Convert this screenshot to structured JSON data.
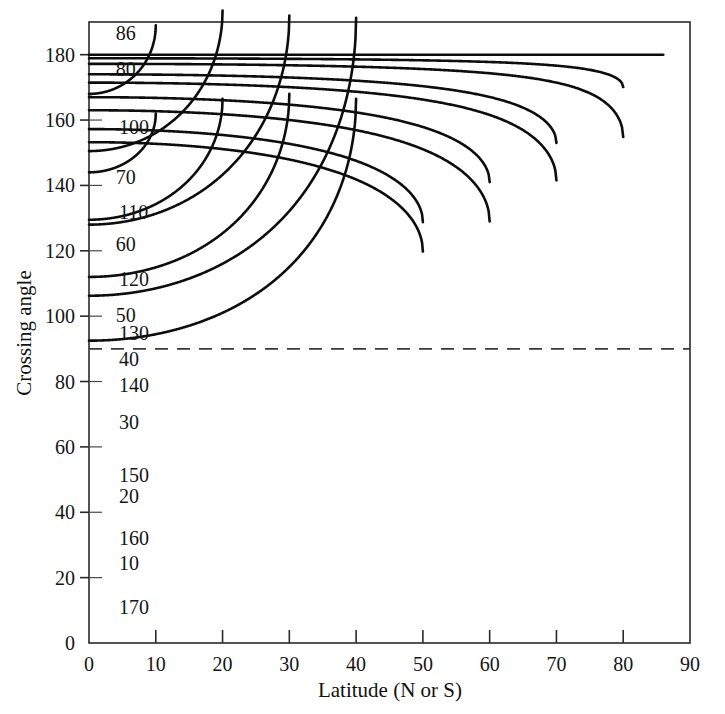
{
  "chart_data": {
    "type": "line",
    "title": "",
    "xlabel": "Latitude (N or S)",
    "ylabel": "Crossing angle",
    "xlim": [
      0,
      90
    ],
    "ylim": [
      0,
      190
    ],
    "xticks": [
      0,
      10,
      20,
      30,
      40,
      50,
      60,
      70,
      80,
      90
    ],
    "yticks": [
      0,
      20,
      40,
      60,
      80,
      100,
      120,
      140,
      160,
      180
    ],
    "xtick_labels": [
      "0",
      "10",
      "20",
      "30",
      "40",
      "50",
      "60",
      "70",
      "80",
      "90"
    ],
    "ytick_labels": [
      "0",
      "20",
      "40",
      "60",
      "80",
      "100",
      "120",
      "140",
      "160",
      "180"
    ],
    "grid": false,
    "legend": "none",
    "annotations": [
      {
        "name": "dashed-reference-line",
        "orientation": "horizontal",
        "y": 90,
        "style": "dashed",
        "label": ""
      }
    ],
    "series": [
      {
        "name": "86",
        "label": "86",
        "start_angle": 180,
        "vertex_latitude": 86,
        "label_x": 4.0,
        "label_y": 186.5
      },
      {
        "name": "80",
        "label": "80",
        "start_angle": 169,
        "vertex_latitude": 80,
        "label_x": 4.0,
        "label_y": 175.5
      },
      {
        "name": "100",
        "label": "100",
        "start_angle": 152,
        "vertex_latitude": 80,
        "label_x": 4.5,
        "label_y": 158.0
      },
      {
        "name": "70",
        "label": "70",
        "start_angle": 147,
        "vertex_latitude": 70,
        "label_x": 4.0,
        "label_y": 142.5
      },
      {
        "name": "110",
        "label": "110",
        "start_angle": 133,
        "vertex_latitude": 70,
        "label_x": 4.5,
        "label_y": 132.0
      },
      {
        "name": "60",
        "label": "60",
        "start_angle": 128,
        "vertex_latitude": 60,
        "label_x": 4.0,
        "label_y": 122.0
      },
      {
        "name": "120",
        "label": "120",
        "start_angle": 112,
        "vertex_latitude": 60,
        "label_x": 4.5,
        "label_y": 111.5
      },
      {
        "name": "50",
        "label": "50",
        "start_angle": 106,
        "vertex_latitude": 50,
        "label_x": 4.0,
        "label_y": 100.5
      },
      {
        "name": "130",
        "label": "130",
        "start_angle": 93,
        "vertex_latitude": 50,
        "label_x": 4.5,
        "label_y": 95.0
      },
      {
        "name": "40",
        "label": "40",
        "start_angle": 85,
        "vertex_latitude": 40,
        "label_x": 4.5,
        "label_y": 87.0
      },
      {
        "name": "140",
        "label": "140",
        "start_angle": 74,
        "vertex_latitude": 40,
        "label_x": 4.5,
        "label_y": 79.0
      },
      {
        "name": "30",
        "label": "30",
        "start_angle": 64,
        "vertex_latitude": 30,
        "label_x": 4.5,
        "label_y": 67.5
      },
      {
        "name": "150",
        "label": "150",
        "start_angle": 56,
        "vertex_latitude": 30,
        "label_x": 4.5,
        "label_y": 51.5
      },
      {
        "name": "20",
        "label": "20",
        "start_angle": 43,
        "vertex_latitude": 20,
        "label_x": 4.5,
        "label_y": 45.0
      },
      {
        "name": "160",
        "label": "160",
        "start_angle": 37,
        "vertex_latitude": 20,
        "label_x": 4.5,
        "label_y": 32.0
      },
      {
        "name": "10",
        "label": "10",
        "start_angle": 21,
        "vertex_latitude": 10,
        "label_x": 4.5,
        "label_y": 24.5
      },
      {
        "name": "170",
        "label": "170",
        "start_angle": 18,
        "vertex_latitude": 10,
        "label_x": 4.5,
        "label_y": 11.0
      }
    ]
  },
  "axes": {
    "y_title": "Crossing angle",
    "x_title": "Latitude (N or S)"
  }
}
